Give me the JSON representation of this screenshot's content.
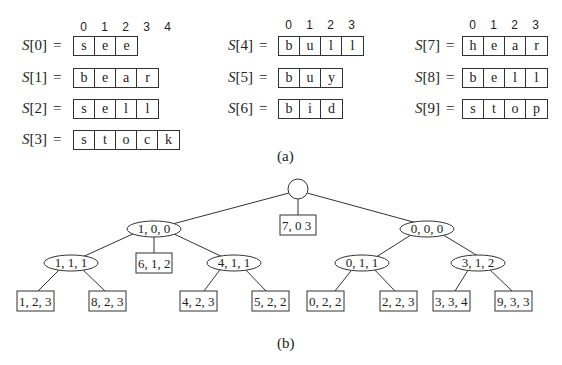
{
  "part_a": {
    "caption": "(a)",
    "columns": [
      {
        "indices": [
          "0",
          "1",
          "2",
          "3",
          "4"
        ],
        "strings": [
          {
            "label": "S",
            "index": "[0]",
            "eq": "=",
            "chars": [
              "s",
              "e",
              "e"
            ]
          },
          {
            "label": "S",
            "index": "[1]",
            "eq": "=",
            "chars": [
              "b",
              "e",
              "a",
              "r"
            ]
          },
          {
            "label": "S",
            "index": "[2]",
            "eq": "=",
            "chars": [
              "s",
              "e",
              "l",
              "l"
            ]
          },
          {
            "label": "S",
            "index": "[3]",
            "eq": "=",
            "chars": [
              "s",
              "t",
              "o",
              "c",
              "k"
            ]
          }
        ]
      },
      {
        "indices": [
          "0",
          "1",
          "2",
          "3"
        ],
        "strings": [
          {
            "label": "S",
            "index": "[4]",
            "eq": "=",
            "chars": [
              "b",
              "u",
              "l",
              "l"
            ]
          },
          {
            "label": "S",
            "index": "[5]",
            "eq": "=",
            "chars": [
              "b",
              "u",
              "y"
            ]
          },
          {
            "label": "S",
            "index": "[6]",
            "eq": "=",
            "chars": [
              "b",
              "i",
              "d"
            ]
          }
        ]
      },
      {
        "indices": [
          "0",
          "1",
          "2",
          "3"
        ],
        "strings": [
          {
            "label": "S",
            "index": "[7]",
            "eq": "=",
            "chars": [
              "h",
              "e",
              "a",
              "r"
            ]
          },
          {
            "label": "S",
            "index": "[8]",
            "eq": "=",
            "chars": [
              "b",
              "e",
              "l",
              "l"
            ]
          },
          {
            "label": "S",
            "index": "[9]",
            "eq": "=",
            "chars": [
              "s",
              "t",
              "o",
              "p"
            ]
          }
        ]
      }
    ]
  },
  "part_b": {
    "caption": "(b)",
    "tree": {
      "root": {
        "type": "circle",
        "label": ""
      },
      "internal": [
        {
          "id": "n100",
          "label": "1, 0, 0"
        },
        {
          "id": "n000",
          "label": "0, 0, 0"
        },
        {
          "id": "n111",
          "label": "1, 1, 1"
        },
        {
          "id": "n411",
          "label": "4, 1, 1"
        },
        {
          "id": "n011",
          "label": "0, 1, 1"
        },
        {
          "id": "n312",
          "label": "3, 1, 2"
        }
      ],
      "leaves": [
        {
          "id": "l703",
          "label": "7, 0 3"
        },
        {
          "id": "l612",
          "label": "6, 1, 2"
        },
        {
          "id": "l123",
          "label": "1, 2, 3"
        },
        {
          "id": "l823",
          "label": "8, 2, 3"
        },
        {
          "id": "l423",
          "label": "4, 2, 3"
        },
        {
          "id": "l522",
          "label": "5, 2, 2"
        },
        {
          "id": "l022",
          "label": "0, 2, 2"
        },
        {
          "id": "l223",
          "label": "2, 2, 3"
        },
        {
          "id": "l334",
          "label": "3, 3, 4"
        },
        {
          "id": "l933",
          "label": "9, 3, 3"
        }
      ]
    }
  }
}
